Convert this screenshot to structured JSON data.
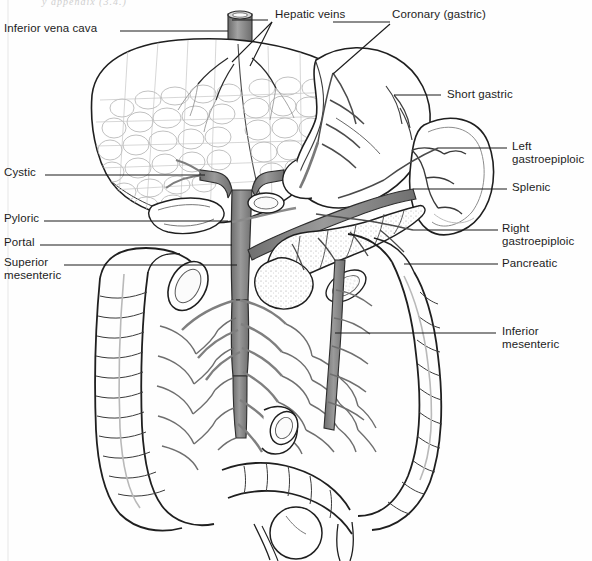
{
  "figure": {
    "top_partial_text": "y appendix (3.4.)",
    "ink_color": "#1a1a1a",
    "vessel_fill": "#8a8a8a",
    "vessel_fill_light": "#b9b9b9",
    "organ_outline": "#222222",
    "background": "#fefefe"
  },
  "labels": {
    "left": [
      {
        "id": "inferior-vena-cava",
        "text": "Inferior vena cava",
        "x": 4,
        "y": 22,
        "leader_from_x": 120,
        "leader_y": 31,
        "leader_to_x": 228
      },
      {
        "id": "cystic",
        "text": "Cystic",
        "x": 4,
        "y": 166,
        "leader_from_x": 45,
        "leader_y": 175,
        "leader_to_x": 205
      },
      {
        "id": "pyloric",
        "text": "Pyloric",
        "x": 4,
        "y": 212,
        "leader_from_x": 44,
        "leader_y": 221,
        "leader_to_x": 228
      },
      {
        "id": "portal",
        "text": "Portal",
        "x": 4,
        "y": 236,
        "leader_from_x": 40,
        "leader_y": 245,
        "leader_to_x": 232
      },
      {
        "id": "superior-mesenteric",
        "text": "Superior\nmesenteric",
        "x": 4,
        "y": 256,
        "leader_from_x": 64,
        "leader_y": 265,
        "leader_to_x": 237
      }
    ],
    "right": [
      {
        "id": "hepatic-veins",
        "text": "Hepatic veins",
        "x": 275,
        "y": 8,
        "leader_from_x": 268,
        "leader_y": 20,
        "leader_to_x": 232
      },
      {
        "id": "coronary-gastric",
        "text": "Coronary (gastric)",
        "x": 392,
        "y": 8,
        "leader_from_x": 390,
        "leader_y": 22,
        "leader_to_x": 333
      },
      {
        "id": "short-gastric",
        "text": "Short gastric",
        "x": 447,
        "y": 88,
        "leader_from_x": 441,
        "leader_y": 95,
        "leader_to_x": 394
      },
      {
        "id": "left-gastroepiploic",
        "text": "Left\ngastroepiploic",
        "x": 512,
        "y": 140,
        "leader_from_x": 507,
        "leader_y": 148,
        "leader_to_x": 438
      },
      {
        "id": "splenic",
        "text": "Splenic",
        "x": 512,
        "y": 181,
        "leader_from_x": 507,
        "leader_y": 189,
        "leader_to_x": 413
      },
      {
        "id": "right-gastroepiploic",
        "text": "Right\ngastroepiploic",
        "x": 502,
        "y": 222,
        "leader_from_x": 498,
        "leader_y": 230,
        "leader_to_x": 413
      },
      {
        "id": "pancreatic",
        "text": "Pancreatic",
        "x": 502,
        "y": 257,
        "leader_from_x": 498,
        "leader_y": 264,
        "leader_to_x": 404
      },
      {
        "id": "inferior-mesenteric",
        "text": "Inferior\nmesenteric",
        "x": 502,
        "y": 325,
        "leader_from_x": 496,
        "leader_y": 333,
        "leader_to_x": 335
      }
    ]
  },
  "anatomy": {
    "organs": [
      "liver",
      "inferior-vena-cava",
      "hepatic-veins",
      "gallbladder",
      "stomach",
      "spleen",
      "pancreas",
      "duodenum",
      "ascending-colon",
      "transverse-colon",
      "descending-colon",
      "sigmoid-colon",
      "small-intestine",
      "rectum",
      "cecum",
      "appendix"
    ],
    "veins": [
      "portal-vein",
      "splenic-vein",
      "superior-mesenteric-vein",
      "inferior-mesenteric-vein",
      "coronary-gastric-vein",
      "short-gastric-vein",
      "left-gastroepiploic-vein",
      "right-gastroepiploic-vein",
      "pancreatic-vein",
      "cystic-vein",
      "pyloric-vein"
    ]
  }
}
